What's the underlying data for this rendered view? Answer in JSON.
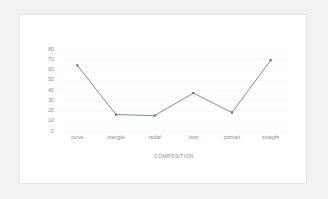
{
  "chart_data": {
    "type": "line",
    "title": "",
    "subtitle": "",
    "xlabel": "COMPOSITION",
    "ylabel": "",
    "categories": [
      "curve",
      "triangle",
      "radial",
      "loop",
      "portrait",
      "straight"
    ],
    "values": [
      64,
      16,
      15,
      37,
      18,
      69
    ],
    "series": [
      {
        "name": "",
        "values": [
          64,
          16,
          15,
          37,
          18,
          69
        ]
      }
    ],
    "ylim": [
      0,
      80
    ],
    "yticks": [
      80,
      70,
      60,
      50,
      40,
      30,
      20,
      10,
      0
    ],
    "ytick_labels": [
      "80",
      "70",
      "60",
      "50",
      "40",
      "30",
      "20",
      "10",
      "0"
    ],
    "grid": true,
    "legend": false,
    "legend_position": "none",
    "markers": true,
    "colors": {
      "line": "#6b7f9e",
      "marker": "#5d7292",
      "gridline": "#fafafa",
      "tick_text": "#8a8a8a",
      "panel_background": "#ffffff",
      "panel_border": "#e6e6e6",
      "page_background": "#f2f2f2"
    }
  }
}
